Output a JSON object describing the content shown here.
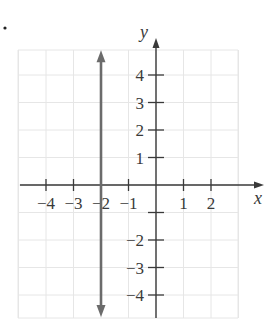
{
  "chart_data": {
    "type": "line",
    "title": "",
    "xlabel": "x",
    "ylabel": "y",
    "xlim": [
      -5,
      4
    ],
    "ylim": [
      -5,
      5
    ],
    "grid": true,
    "x_ticks": [
      -4,
      -3,
      -2,
      -1,
      1,
      2
    ],
    "x_tick_labels": [
      "−4",
      "−3",
      "−2",
      "−1",
      "1",
      "2"
    ],
    "y_ticks": [
      4,
      3,
      2,
      1,
      -2,
      -3,
      -4
    ],
    "y_tick_labels": [
      "4",
      "3",
      "2",
      "1",
      "−2",
      "−3",
      "−4"
    ],
    "series": [
      {
        "name": "x = -2",
        "description": "vertical line x = -2 with arrows at both ends",
        "x": [
          -2,
          -2
        ],
        "y": [
          4.9,
          -4.8
        ],
        "color": "#6b6b6b"
      }
    ]
  },
  "colors": {
    "axis": "#3a3a3a",
    "grid": "#e6e6e6",
    "line": "#6b6b6b"
  }
}
